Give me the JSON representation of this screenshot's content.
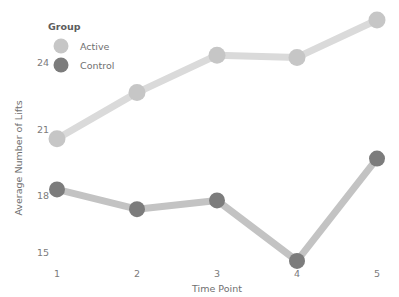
{
  "chart_data": {
    "type": "line",
    "title": "",
    "xlabel": "Time Point",
    "ylabel": "Average Number of Lifts",
    "x": [
      1,
      2,
      3,
      4,
      5
    ],
    "categories": [
      "1",
      "2",
      "3",
      "4",
      "5"
    ],
    "xtick_labels": [
      "1",
      "2",
      "3",
      "4",
      "5"
    ],
    "ytick_labels": [
      "15",
      "18",
      "21",
      "24"
    ],
    "yticks": [
      15,
      18,
      21,
      24
    ],
    "ylim": [
      14.2,
      26.7
    ],
    "xlim": [
      0.75,
      5.25
    ],
    "grid": false,
    "legend_position": "top-left-inside",
    "legend_title": "Group",
    "series": [
      {
        "name": "Active",
        "values": [
          20.6,
          22.7,
          24.4,
          24.3,
          26.0
        ],
        "line_color": "#dadada",
        "marker_color": "#c6c6c6"
      },
      {
        "name": "Control",
        "values": [
          18.3,
          17.4,
          17.8,
          15.05,
          19.7
        ],
        "line_color": "#c3c3c3",
        "marker_color": "#7c7c7c"
      }
    ]
  },
  "axes": {
    "y_title": "Average Number of Lifts",
    "x_title": "Time Point",
    "y_ticks": [
      {
        "label": "24",
        "value": 24
      },
      {
        "label": "21",
        "value": 21
      },
      {
        "label": "18",
        "value": 18
      },
      {
        "label": "15",
        "value": 15
      }
    ],
    "x_ticks": [
      {
        "label": "1",
        "value": 1
      },
      {
        "label": "2",
        "value": 2
      },
      {
        "label": "3",
        "value": 3
      },
      {
        "label": "4",
        "value": 4
      },
      {
        "label": "5",
        "value": 5
      }
    ]
  },
  "legend": {
    "title": "Group",
    "items": [
      {
        "label": "Active",
        "color": "#c6c6c6"
      },
      {
        "label": "Control",
        "color": "#7c7c7c"
      }
    ]
  },
  "colors": {
    "background": "#ffffff",
    "active": "#c6c6c6",
    "active_line": "#dadada",
    "control": "#7c7c7c",
    "control_line": "#c3c3c3",
    "text": "#6f6f6f"
  }
}
